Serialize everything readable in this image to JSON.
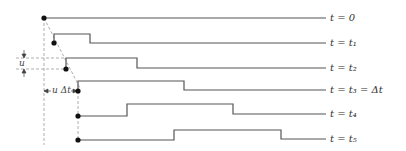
{
  "diagram": {
    "type": "traveling-wave-snapshots",
    "line_color": "#555555",
    "guide_color": "#999999",
    "snapshots": [
      {
        "label": "t = 0",
        "label_html": "t = 0"
      },
      {
        "label": "t = t1",
        "label_html": "t = t₁"
      },
      {
        "label": "t = t2",
        "label_html": "t = t₂"
      },
      {
        "label": "t = t3 = Δt",
        "label_html": "t = t₃ = Δt"
      },
      {
        "label": "t = t4",
        "label_html": "t = t₄"
      },
      {
        "label": "t = t5",
        "label_html": "t = t₅"
      }
    ],
    "annotations": {
      "u_label": "u",
      "u_dt_label": "u Δt"
    }
  }
}
